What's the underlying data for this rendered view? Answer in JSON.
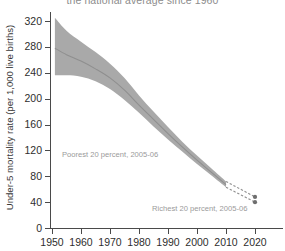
{
  "chart_data": {
    "type": "area",
    "title": "the national average since 1960",
    "xlabel": "",
    "ylabel": "Under-5 mortality rate (per 1,000 live births)",
    "xlim": [
      1948,
      2022
    ],
    "ylim": [
      0,
      336
    ],
    "grid": false,
    "legend": "none",
    "xticks": [
      1950,
      1960,
      1970,
      1980,
      1990,
      2000,
      2010,
      2020
    ],
    "xtick_labels": [
      "1950",
      "1960",
      "1970",
      "1980",
      "1990",
      "2000",
      "2010",
      "2020"
    ],
    "yticks": [
      0,
      40,
      80,
      120,
      160,
      200,
      240,
      280,
      320
    ],
    "ytick_labels": [
      "0",
      "40",
      "80",
      "120",
      "160",
      "200",
      "240",
      "280",
      "320"
    ],
    "band_color": "#a9a9a9",
    "line_color": "#8f8f8f",
    "x": [
      1951,
      1955,
      1960,
      1965,
      1970,
      1975,
      1980,
      1985,
      1990,
      1995,
      2000,
      2005,
      2010
    ],
    "series": [
      {
        "name": "upper bound",
        "values": [
          325,
          305,
          288,
          272,
          254,
          232,
          205,
          180,
          156,
          133,
          112,
          92,
          72
        ]
      },
      {
        "name": "central estimate",
        "values": [
          278,
          268,
          258,
          246,
          232,
          213,
          190,
          168,
          146,
          125,
          105,
          86,
          67
        ]
      },
      {
        "name": "lower bound",
        "values": [
          236,
          236,
          234,
          227,
          215,
          198,
          178,
          157,
          137,
          118,
          99,
          81,
          63
        ]
      }
    ],
    "endpoints": [
      {
        "label": "Poorest 20 percent, 2005-06",
        "x": 2020,
        "y": 48,
        "marker": "dot",
        "connector": "dashed"
      },
      {
        "label": "Richest 20 percent, 2005-06",
        "x": 2020,
        "y": 40,
        "marker": "dot",
        "connector": "dashed"
      }
    ],
    "annotations": [
      {
        "text": "Poorest 20 percent, 2005-06"
      },
      {
        "text": "Richest 20 percent, 2005-06"
      }
    ]
  }
}
